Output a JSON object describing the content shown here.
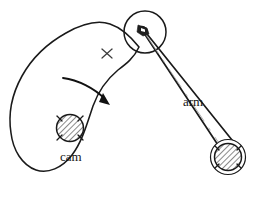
{
  "figure": {
    "kind": "mechanical-diagram",
    "width": 259,
    "height": 199,
    "background_color": "#ffffff",
    "ink_color": "#1a1a1a"
  },
  "labels": {
    "cam": "cam",
    "arm": "arm"
  },
  "components": {
    "cam_profile": {
      "name": "cam",
      "shape": "teardrop",
      "label": "cam"
    },
    "cam_hub": {
      "name": "cam-shaft-hub",
      "style": "cross-hatched circle with centerline ticks",
      "center": [
        70,
        128
      ],
      "radius": 14
    },
    "roller": {
      "name": "roller-follower",
      "style": "circle with pin at center",
      "center": [
        145,
        32
      ],
      "radius": 21
    },
    "roller_pin": {
      "name": "roller-pin",
      "center": [
        143,
        30
      ]
    },
    "arm": {
      "name": "follower-arm",
      "style": "tapered link with centerline",
      "label": "arm",
      "from": [
        143,
        30
      ],
      "to": [
        228,
        157
      ]
    },
    "arm_pivot": {
      "name": "arm-pivot-bearing",
      "style": "double-ring cross-hatched circle",
      "center": [
        228,
        157
      ],
      "outer_radius": 17,
      "inner_radius": 14
    },
    "rotation_arrow": {
      "name": "cam-rotation-arrow",
      "direction": "clockwise"
    },
    "cross_mark": {
      "name": "contact-point-cross-mark",
      "glyph": "×",
      "position": [
        107,
        53
      ]
    }
  },
  "colors": {
    "ink": "#1a1a1a",
    "hatch": "#2b2b2b",
    "centerline": "#9a9a9a",
    "background": "#ffffff"
  }
}
